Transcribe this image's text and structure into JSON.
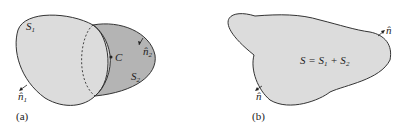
{
  "figure": {
    "panel_a": {
      "caption": "(a)",
      "surface1_label": "S",
      "surface1_sub": "1",
      "surface2_label": "S",
      "surface2_sub": "2",
      "curve_label": "C",
      "normal1_label": "n̂",
      "normal1_sub": "1",
      "normal2_label": "n̂",
      "normal2_sub": "2"
    },
    "panel_b": {
      "caption": "(b)",
      "equation": "S = S",
      "eq_sub1": "1",
      "eq_plus": " + S",
      "eq_sub2": "2",
      "normal_top_label": "n̂",
      "normal_bottom_label": "n̂"
    },
    "colors": {
      "light_fill": "#dcdcdc",
      "dark_fill": "#b4b4b4",
      "stroke": "#333333"
    }
  }
}
